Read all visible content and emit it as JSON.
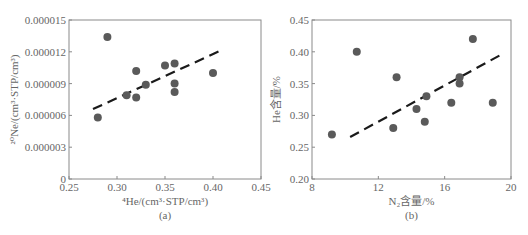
{
  "chart_data": [
    {
      "type": "scatter",
      "panel_label": "(a)",
      "title": "",
      "xlabel": "⁴He/(cm³·STP/cm³)",
      "ylabel": "²⁰Ne/(cm³·STP/cm³)",
      "xlim": [
        0.25,
        0.45
      ],
      "ylim": [
        0,
        1.5e-05
      ],
      "xticks": [
        "0.25",
        "0.30",
        "0.35",
        "0.40",
        "0.45"
      ],
      "yticks": [
        "0",
        "0.000003",
        "0.000006",
        "0.000009",
        "0.000012",
        "0.000015"
      ],
      "grid": false,
      "legend": null,
      "series": [
        {
          "name": "samples",
          "x": [
            0.28,
            0.29,
            0.31,
            0.32,
            0.32,
            0.33,
            0.35,
            0.36,
            0.36,
            0.36,
            0.4
          ],
          "y": [
            5.8e-06,
            1.34e-05,
            7.9e-06,
            1.02e-05,
            7.7e-06,
            8.9e-06,
            1.07e-05,
            1.09e-05,
            9e-06,
            8.2e-06,
            1e-05
          ]
        }
      ],
      "trendline": {
        "style": "dashed",
        "x": [
          0.275,
          0.41
        ],
        "y": [
          6.6e-06,
          1.22e-05
        ]
      }
    },
    {
      "type": "scatter",
      "panel_label": "(b)",
      "title": "",
      "xlabel": "N₂含量/%",
      "ylabel": "He含量/%",
      "xlim": [
        8,
        20
      ],
      "ylim": [
        0.2,
        0.45
      ],
      "xticks": [
        "8",
        "12",
        "16",
        "20"
      ],
      "yticks": [
        "0.20",
        "0.25",
        "0.30",
        "0.35",
        "0.40",
        "0.45"
      ],
      "grid": false,
      "legend": null,
      "series": [
        {
          "name": "samples",
          "x": [
            9.2,
            10.7,
            12.9,
            13.1,
            14.3,
            14.8,
            14.9,
            16.4,
            16.9,
            16.9,
            17.7,
            18.9
          ],
          "y": [
            0.27,
            0.4,
            0.28,
            0.36,
            0.31,
            0.29,
            0.33,
            0.32,
            0.36,
            0.35,
            0.42,
            0.32
          ]
        }
      ],
      "trendline": {
        "style": "dashed",
        "x": [
          10.3,
          19.3
        ],
        "y": [
          0.266,
          0.394
        ]
      }
    }
  ],
  "layout": {
    "panels": [
      {
        "left": 69,
        "top": 20,
        "right": 261,
        "bottom": 179
      },
      {
        "left": 312,
        "top": 20,
        "right": 511,
        "bottom": 179
      }
    ],
    "colors": {
      "dot": "#5a5a5a",
      "frame": "#8a8a8a",
      "trend": "#1a1a1a",
      "text": "#666666"
    }
  }
}
